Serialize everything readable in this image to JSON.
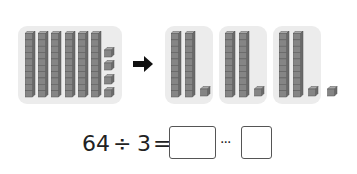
{
  "figure": {
    "source_group": {
      "tens_rods": 6,
      "unit_cubes": 4
    },
    "arrow": "arrow-right-icon",
    "result_groups": [
      {
        "tens_rods": 2,
        "unit_cubes": 1
      },
      {
        "tens_rods": 2,
        "unit_cubes": 1
      },
      {
        "tens_rods": 2,
        "unit_cubes": 1
      }
    ],
    "remainder_cubes": 1
  },
  "equation": {
    "dividend": "64",
    "operator": "÷",
    "divisor": "3",
    "equals": "=",
    "quotient_box": "",
    "remainder_separator": "···",
    "remainder_box": ""
  },
  "colors": {
    "panel": "#ececec",
    "block_fill": "#808080",
    "block_edge": "#555555",
    "text": "#222222"
  }
}
